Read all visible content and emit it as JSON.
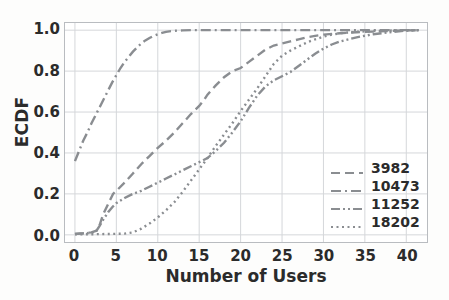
{
  "chart_data": {
    "type": "line",
    "title": "",
    "xlabel": "Number of Users",
    "ylabel": "ECDF",
    "xlim": [
      -1.2,
      42.5
    ],
    "ylim": [
      -0.035,
      1.035
    ],
    "xticks": [
      0,
      5,
      10,
      15,
      20,
      25,
      30,
      35,
      40
    ],
    "xtick_labels": [
      "0",
      "5",
      "10",
      "15",
      "20",
      "25",
      "30",
      "35",
      "40"
    ],
    "yticks": [
      0.0,
      0.2,
      0.4,
      0.6,
      0.8,
      1.0
    ],
    "ytick_labels": [
      "0.0",
      "0.2",
      "0.4",
      "0.6",
      "0.8",
      "1.0"
    ],
    "grid": true,
    "grid_color": "#d5d7da",
    "legend_position": "lower right",
    "line_color": "#8a8d91",
    "series": [
      {
        "name": "3982",
        "dash": "dashed",
        "stroke_dasharray": "9 5",
        "x": [
          0,
          1,
          2,
          2.6,
          3,
          3.4,
          4,
          4.6,
          5,
          6,
          7,
          8,
          9,
          10,
          11,
          12,
          13,
          14,
          15,
          15.6,
          16,
          17,
          18,
          19,
          20,
          21,
          22,
          23,
          24,
          25,
          26,
          27,
          28,
          29,
          30,
          32,
          34,
          36,
          38,
          40,
          41.5
        ],
        "y": [
          0.005,
          0.008,
          0.012,
          0.02,
          0.05,
          0.1,
          0.15,
          0.2,
          0.215,
          0.255,
          0.3,
          0.345,
          0.385,
          0.425,
          0.46,
          0.5,
          0.545,
          0.59,
          0.63,
          0.66,
          0.685,
          0.73,
          0.77,
          0.8,
          0.815,
          0.845,
          0.875,
          0.905,
          0.925,
          0.935,
          0.945,
          0.955,
          0.965,
          0.972,
          0.978,
          0.985,
          0.99,
          0.993,
          0.996,
          0.999,
          1.0
        ]
      },
      {
        "name": "10473",
        "dash": "dashdot",
        "stroke_dasharray": "10 4 2 4",
        "x": [
          0,
          0.4,
          1,
          1.5,
          2,
          2.5,
          3,
          3.5,
          4,
          4.5,
          5,
          5.5,
          6,
          6.5,
          7,
          7.5,
          8,
          8.5,
          9,
          9.5,
          10,
          10.5,
          11,
          12,
          13,
          14,
          16,
          20,
          25,
          30,
          35,
          41.5
        ],
        "y": [
          0.36,
          0.4,
          0.46,
          0.5,
          0.545,
          0.585,
          0.625,
          0.665,
          0.705,
          0.745,
          0.78,
          0.815,
          0.845,
          0.87,
          0.895,
          0.915,
          0.935,
          0.95,
          0.962,
          0.972,
          0.98,
          0.987,
          0.992,
          0.997,
          0.999,
          1.0,
          1.0,
          1.0,
          1.0,
          1.0,
          1.0,
          1.0
        ]
      },
      {
        "name": "11252",
        "dash": "dashdotdot",
        "stroke_dasharray": "9 3 2 3 2 3",
        "x": [
          0,
          1,
          2,
          2.6,
          3,
          3.5,
          4,
          4.5,
          5,
          6,
          7,
          8,
          9,
          10,
          11,
          12,
          13,
          14,
          15,
          16,
          17,
          18,
          19,
          20,
          21,
          22,
          23,
          24,
          25,
          26,
          27,
          28,
          29,
          30,
          31,
          32,
          34,
          36,
          38,
          40,
          41.5
        ],
        "y": [
          0.004,
          0.007,
          0.01,
          0.02,
          0.045,
          0.08,
          0.11,
          0.135,
          0.155,
          0.18,
          0.2,
          0.215,
          0.235,
          0.255,
          0.275,
          0.295,
          0.315,
          0.335,
          0.355,
          0.375,
          0.41,
          0.45,
          0.5,
          0.555,
          0.62,
          0.68,
          0.725,
          0.755,
          0.775,
          0.795,
          0.825,
          0.855,
          0.885,
          0.91,
          0.93,
          0.945,
          0.965,
          0.98,
          0.99,
          0.998,
          1.0
        ]
      },
      {
        "name": "18202",
        "dash": "dotted",
        "stroke_dasharray": "2 3.5",
        "x": [
          0,
          2,
          4,
          6,
          7,
          8,
          9,
          10,
          11,
          12,
          13,
          14,
          15,
          16,
          17,
          18,
          19,
          20,
          21,
          22,
          23,
          24,
          25,
          26,
          27,
          28,
          29,
          30,
          31,
          32,
          34,
          36,
          38,
          40,
          41.5
        ],
        "y": [
          0.002,
          0.003,
          0.004,
          0.006,
          0.012,
          0.03,
          0.055,
          0.085,
          0.12,
          0.16,
          0.21,
          0.265,
          0.32,
          0.375,
          0.435,
          0.49,
          0.545,
          0.605,
          0.66,
          0.715,
          0.775,
          0.835,
          0.875,
          0.9,
          0.92,
          0.94,
          0.955,
          0.968,
          0.978,
          0.985,
          0.992,
          0.996,
          0.998,
          0.999,
          1.0
        ]
      }
    ]
  }
}
